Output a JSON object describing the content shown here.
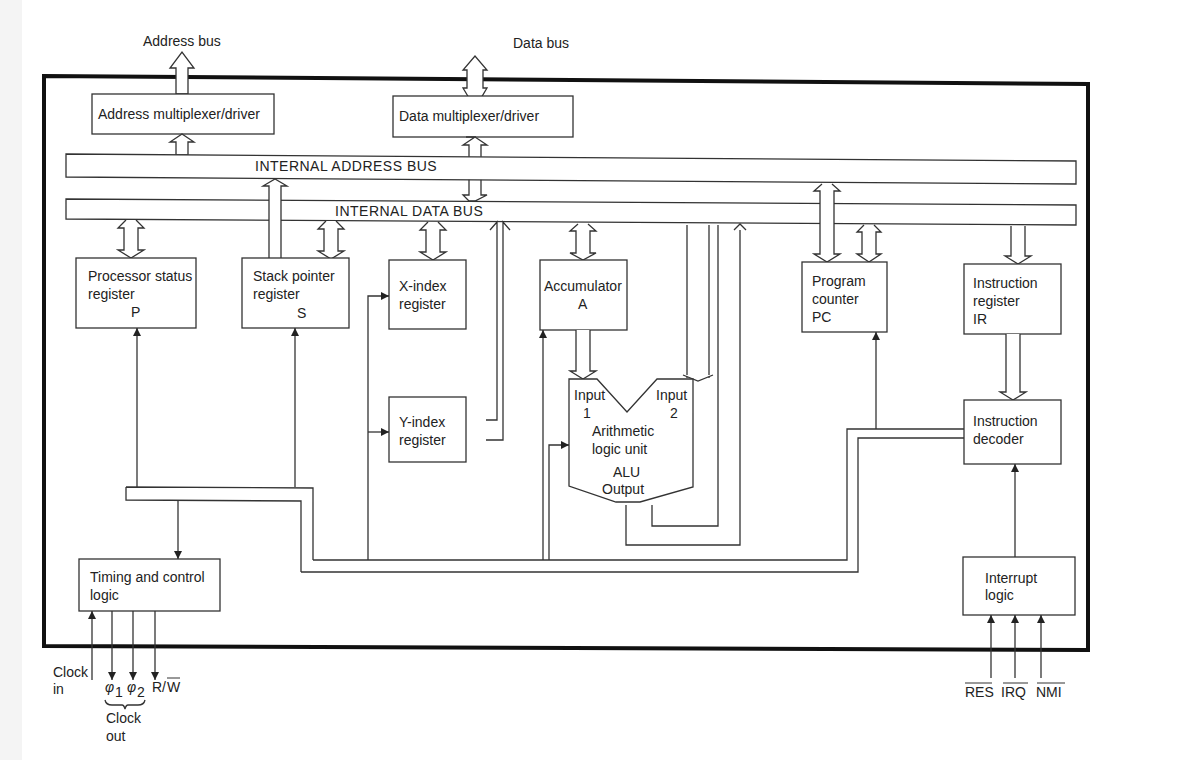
{
  "diagram": {
    "external": {
      "address_bus": "Address bus",
      "data_bus": "Data bus"
    },
    "blocks": {
      "addr_mux": "Address multiplexer/driver",
      "data_mux": "Data multiplexer/driver",
      "internal_address_bus": "INTERNAL ADDRESS BUS",
      "internal_data_bus": "INTERNAL DATA BUS",
      "p_reg": {
        "line1": "Processor status",
        "line2": "register",
        "line3": "P"
      },
      "s_reg": {
        "line1": "Stack pointer",
        "line2": "register",
        "line3": "S"
      },
      "x_reg": {
        "line1": "X-index",
        "line2": "register"
      },
      "y_reg": {
        "line1": "Y-index",
        "line2": "register"
      },
      "acc": {
        "line1": "Accumulator",
        "line2": "A"
      },
      "alu": {
        "input1_a": "Input",
        "input1_b": "1",
        "input2_a": "Input",
        "input2_b": "2",
        "line1": "Arithmetic",
        "line2": "logic unit",
        "line3": "ALU",
        "line4": "Output"
      },
      "pc": {
        "line1": "Program",
        "line2": "counter",
        "line3": "PC"
      },
      "ir": {
        "line1": "Instruction",
        "line2": "register",
        "line3": "IR"
      },
      "decoder": {
        "line1": "Instruction",
        "line2": "decoder"
      },
      "timing": {
        "line1": "Timing and control",
        "line2": "logic"
      },
      "interrupt": {
        "line1": "Interrupt",
        "line2": "logic"
      }
    },
    "signals": {
      "clock_in_1": "Clock",
      "clock_in_2": "in",
      "phi1": "φ",
      "phi1_sub": "1",
      "phi2": "φ",
      "phi2_sub": "2",
      "rw_r": "R/",
      "rw_w": "W",
      "clock_out_1": "Clock",
      "clock_out_2": "out",
      "res": "RES",
      "irq": "IRQ",
      "nmi": "NMI"
    }
  }
}
